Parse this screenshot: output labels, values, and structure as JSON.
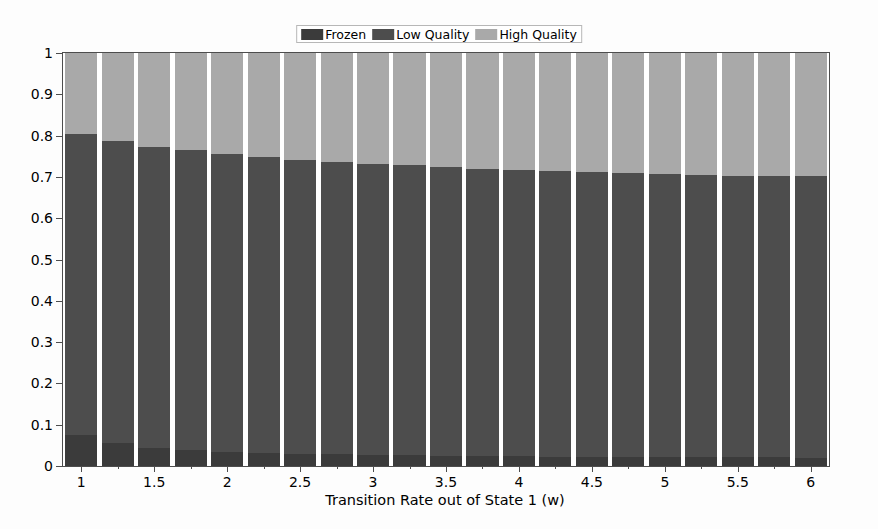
{
  "chart": {
    "type": "stacked_bar",
    "title": "",
    "xlabel": "Transition Rate out of State 1 (w)",
    "ylabel": "",
    "background_color": "#fdfdfd",
    "axes_color": "#4d4d4d",
    "grid": false,
    "legend_position": "upper center"
  },
  "legend": {
    "entries": [
      {
        "label": "Frozen",
        "color": "#3b3b3b"
      },
      {
        "label": "Low Quality",
        "color": "#4d4d4d"
      },
      {
        "label": "High Quality",
        "color": "#a9a9a9"
      }
    ]
  },
  "yaxis": {
    "min": 0,
    "max": 1,
    "ticks": [
      0,
      0.1,
      0.2,
      0.3,
      0.4,
      0.5,
      0.6,
      0.7,
      0.8,
      0.9,
      1
    ],
    "tick_labels": [
      "0",
      "0.1",
      "0.2",
      "0.3",
      "0.4",
      "0.5",
      "0.6",
      "0.7",
      "0.8",
      "0.9",
      "1"
    ]
  },
  "xaxis": {
    "min": 0.875,
    "max": 6.125,
    "ticks": [
      1,
      1.5,
      2,
      2.5,
      3,
      3.5,
      4,
      4.5,
      5,
      5.5,
      6
    ],
    "tick_labels": [
      "1",
      "1.5",
      "2",
      "2.5",
      "3",
      "3.5",
      "4",
      "4.5",
      "5",
      "5.5",
      "6"
    ],
    "minor_ticks": [
      1.25,
      1.75,
      2.25,
      2.75,
      3.25,
      3.75,
      4.25,
      4.75,
      5.25,
      5.75
    ]
  },
  "chart_data": {
    "type": "bar",
    "stacked": true,
    "title": "",
    "xlabel": "Transition Rate out of State 1 (w)",
    "ylabel": "",
    "xlim": [
      0.875,
      6.125
    ],
    "ylim": [
      0,
      1
    ],
    "grid": false,
    "legend": [
      "Frozen",
      "Low Quality",
      "High Quality"
    ],
    "legend_position": "upper center",
    "categories": [
      1,
      1.25,
      1.5,
      1.75,
      2,
      2.25,
      2.5,
      2.75,
      3,
      3.25,
      3.5,
      3.75,
      4,
      4.25,
      4.5,
      4.75,
      5,
      5.25,
      5.5,
      5.75,
      6
    ],
    "series": [
      {
        "name": "Frozen",
        "color": "#3b3b3b",
        "values": [
          0.075,
          0.056,
          0.044,
          0.039,
          0.035,
          0.032,
          0.03,
          0.028,
          0.027,
          0.026,
          0.025,
          0.024,
          0.024,
          0.023,
          0.023,
          0.022,
          0.022,
          0.021,
          0.021,
          0.021,
          0.02
        ]
      },
      {
        "name": "Low Quality",
        "color": "#4d4d4d",
        "values": [
          0.73,
          0.732,
          0.729,
          0.725,
          0.72,
          0.716,
          0.712,
          0.708,
          0.705,
          0.702,
          0.699,
          0.696,
          0.693,
          0.691,
          0.689,
          0.687,
          0.685,
          0.683,
          0.682,
          0.681,
          0.682
        ]
      },
      {
        "name": "High Quality",
        "color": "#a9a9a9",
        "values": [
          0.195,
          0.212,
          0.227,
          0.236,
          0.245,
          0.252,
          0.258,
          0.264,
          0.268,
          0.272,
          0.276,
          0.28,
          0.283,
          0.286,
          0.288,
          0.291,
          0.293,
          0.296,
          0.297,
          0.298,
          0.298
        ]
      }
    ],
    "cumulative_tops": {
      "frozen_top": [
        0.075,
        0.056,
        0.044,
        0.039,
        0.035,
        0.032,
        0.03,
        0.028,
        0.027,
        0.026,
        0.025,
        0.024,
        0.024,
        0.023,
        0.023,
        0.022,
        0.022,
        0.021,
        0.021,
        0.021,
        0.02
      ],
      "low_quality_top": [
        0.805,
        0.788,
        0.773,
        0.764,
        0.755,
        0.748,
        0.742,
        0.736,
        0.732,
        0.728,
        0.724,
        0.72,
        0.717,
        0.714,
        0.712,
        0.709,
        0.707,
        0.704,
        0.703,
        0.702,
        0.702
      ],
      "high_quality_top": [
        1,
        1,
        1,
        1,
        1,
        1,
        1,
        1,
        1,
        1,
        1,
        1,
        1,
        1,
        1,
        1,
        1,
        1,
        1,
        1,
        1
      ]
    }
  }
}
